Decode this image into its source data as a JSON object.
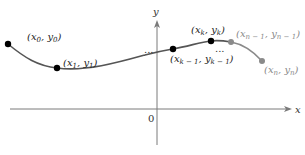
{
  "diagram": {
    "axes": {
      "x_label": "x",
      "y_label": "y",
      "origin_label": "0",
      "x_axis_y": 109,
      "y_axis_x": 157
    },
    "colors": {
      "axis": "#7a7a7a",
      "curve_dark": "#555555",
      "curve_light": "#8a8a8a",
      "point_dark": "#000000",
      "point_light": "#8a8a8a",
      "label_dark": "#222222",
      "label_light": "#8a8a8a"
    },
    "points": [
      {
        "id": "p0",
        "label_base_x": "x",
        "sub_x": "0",
        "label_base_y": "y",
        "sub_y": "0",
        "cx": 8,
        "cy": 44,
        "shade": "dark"
      },
      {
        "id": "p1",
        "label_base_x": "x",
        "sub_x": "1",
        "label_base_y": "y",
        "sub_y": "1",
        "cx": 57,
        "cy": 68,
        "shade": "dark"
      },
      {
        "id": "pkm1",
        "label_base_x": "x",
        "sub_x": "k − 1",
        "label_base_y": "y",
        "sub_y": "k − 1",
        "cx": 173,
        "cy": 49,
        "shade": "dark"
      },
      {
        "id": "pk",
        "label_base_x": "x",
        "sub_x": "k",
        "label_base_y": "y",
        "sub_y": "k",
        "cx": 211,
        "cy": 41,
        "shade": "dark"
      },
      {
        "id": "pnm1",
        "label_base_x": "x",
        "sub_x": "n − 1",
        "label_base_y": "y",
        "sub_y": "n − 1",
        "cx": 231,
        "cy": 42,
        "shade": "light"
      },
      {
        "id": "pn",
        "label_base_x": "x",
        "sub_x": "n",
        "label_base_y": "y",
        "sub_y": "n",
        "cx": 262,
        "cy": 61,
        "shade": "light"
      }
    ],
    "ellipses": [
      {
        "text": "...",
        "x": 145,
        "y": 53
      },
      {
        "text": "...",
        "x": 215,
        "y": 52
      }
    ]
  }
}
